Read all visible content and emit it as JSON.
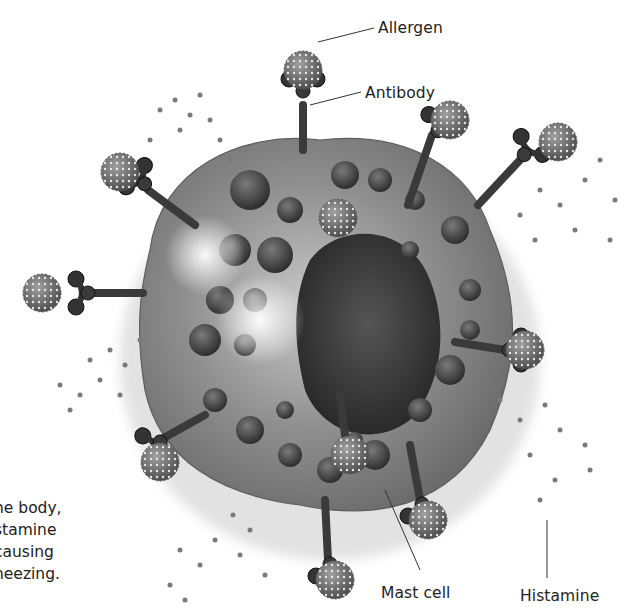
{
  "figure": {
    "colors": {
      "background": "#ffffff",
      "cell_body": "#8a8a8a",
      "cell_rim": "#6b6b6b",
      "nucleus": "#3a3a3a",
      "granule": "#4a4a4a",
      "antibody": "#3c3c3c",
      "allergen": "#7a7a7a",
      "histamine_dot": "#777777",
      "label_text": "#222222",
      "leader_line": "#333333"
    }
  },
  "labels": {
    "allergen": "Allergen",
    "antibody": "Antibody",
    "mast_cell": "Mast cell",
    "histamine": "Histamine"
  },
  "caption": {
    "lines": [
      "he body,",
      "stamine",
      "causing",
      "neezing."
    ]
  }
}
